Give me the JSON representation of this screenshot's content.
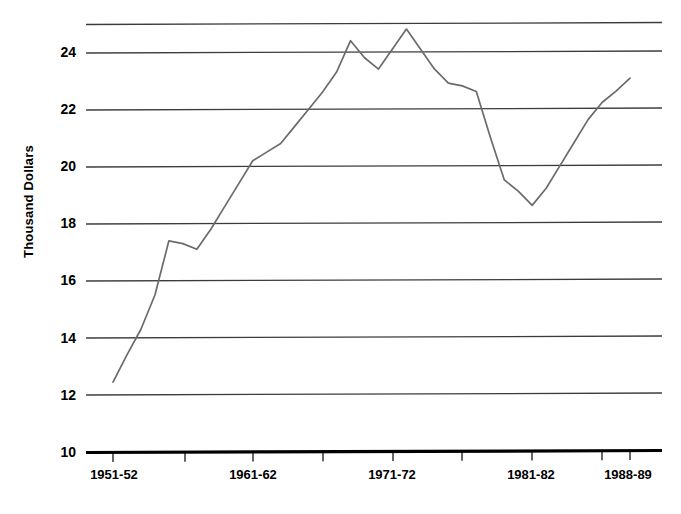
{
  "chart_data": {
    "type": "line",
    "title": "",
    "subtitle": "",
    "xlabel": "",
    "ylabel": "Thousand Dollars",
    "ylim": [
      10,
      25
    ],
    "xlim": [
      1951,
      1989
    ],
    "grid": true,
    "legend": null,
    "y_ticks": [
      10,
      12,
      14,
      16,
      18,
      20,
      22,
      24
    ],
    "y_tick_labels": [
      "10",
      "12",
      "14",
      "16",
      "18",
      "20",
      "22",
      "24"
    ],
    "gridline_values": [
      25,
      24,
      22,
      20,
      18,
      16,
      14,
      12,
      10
    ],
    "x_tick_labels": [
      "1951-52",
      "1961-62",
      "1971-72",
      "1981-82",
      "1988-89"
    ],
    "x_tick_years": [
      1952,
      1962,
      1972,
      1982,
      1989
    ],
    "x": [
      1952,
      1953,
      1954,
      1955,
      1956,
      1957,
      1958,
      1959,
      1960,
      1961,
      1962,
      1963,
      1964,
      1965,
      1966,
      1967,
      1968,
      1969,
      1970,
      1971,
      1972,
      1973,
      1974,
      1975,
      1976,
      1977,
      1978,
      1979,
      1980,
      1981,
      1982,
      1983,
      1984,
      1985,
      1986,
      1987,
      1988,
      1989
    ],
    "values": [
      12.45,
      13.4,
      14.3,
      15.5,
      17.4,
      17.3,
      17.1,
      17.8,
      18.6,
      19.4,
      20.2,
      20.5,
      20.8,
      21.4,
      22.0,
      22.6,
      23.3,
      24.4,
      23.8,
      23.4,
      24.1,
      24.8,
      24.1,
      23.4,
      22.9,
      22.8,
      22.6,
      21.0,
      19.5,
      19.1,
      18.6,
      19.2,
      20.0,
      20.8,
      21.6,
      22.2,
      22.6,
      23.05
    ],
    "series": [
      {
        "name": "Thousand Dollars",
        "color": "#6b6b6b",
        "values": [
          12.45,
          13.4,
          14.3,
          15.5,
          17.4,
          17.3,
          17.1,
          17.8,
          18.6,
          19.4,
          20.2,
          20.5,
          20.8,
          21.4,
          22.0,
          22.6,
          23.3,
          24.4,
          23.8,
          23.4,
          24.1,
          24.8,
          24.1,
          23.4,
          22.9,
          22.8,
          22.6,
          21.0,
          19.5,
          19.1,
          18.6,
          19.2,
          20.0,
          20.8,
          21.6,
          22.2,
          22.6,
          23.05
        ]
      }
    ],
    "colors": {
      "line": "#6b6b6b",
      "grid": "#3c3c3c",
      "axis": "#000000",
      "background": "#ffffff"
    }
  },
  "axis": {
    "y_title": "Thousand Dollars",
    "y_labels": [
      "24",
      "22",
      "20",
      "18",
      "16",
      "14",
      "12",
      "10"
    ],
    "x_labels": [
      "1951-52",
      "1961-62",
      "1971-72",
      "1981-82",
      "1988-89"
    ]
  }
}
